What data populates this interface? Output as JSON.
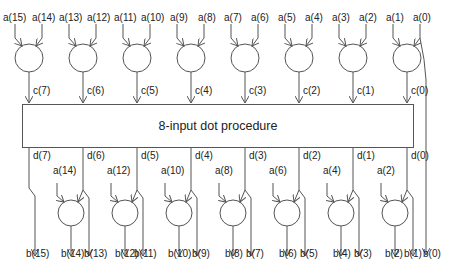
{
  "diagram": {
    "title": "8-input dot procedure",
    "colors": {
      "stroke": "#555555",
      "text": "#222222",
      "background": "#ffffff"
    },
    "top_groups": [
      {
        "inputs": [
          "a(15)",
          "a(14)"
        ],
        "output": "c(7)"
      },
      {
        "inputs": [
          "a(13)",
          "a(12)"
        ],
        "output": "c(6)"
      },
      {
        "inputs": [
          "a(11)",
          "a(10)"
        ],
        "output": "c(5)"
      },
      {
        "inputs": [
          "a(9)",
          "a(8)"
        ],
        "output": "c(4)"
      },
      {
        "inputs": [
          "a(7)",
          "a(6)"
        ],
        "output": "c(3)"
      },
      {
        "inputs": [
          "a(5)",
          "a(4)"
        ],
        "output": "c(2)"
      },
      {
        "inputs": [
          "a(3)",
          "a(2)"
        ],
        "output": "c(1)"
      },
      {
        "inputs": [
          "a(1)",
          "a(0)"
        ],
        "output": "c(0)"
      }
    ],
    "bottom_groups": [
      {
        "d": "d(7)",
        "b_pass": "b(15)",
        "a_in": "a(14)",
        "b_circle": "b(14)",
        "b_right": "b(13)"
      },
      {
        "d": "d(6)",
        "a_in": "a(12)",
        "b_circle": "b(12)",
        "b_right": "b(11)"
      },
      {
        "d": "d(5)",
        "a_in": "a(10)",
        "b_circle": "b(10)",
        "b_right": "b(9)"
      },
      {
        "d": "d(4)",
        "a_in": "a(8)",
        "b_circle": "b(8)",
        "b_right": "b(7)"
      },
      {
        "d": "d(3)",
        "a_in": "a(6)",
        "b_circle": "b(6)",
        "b_right": "b(5)"
      },
      {
        "d": "d(2)",
        "a_in": "a(4)",
        "b_circle": "b(4)",
        "b_right": "b(3)"
      },
      {
        "d": "d(1)",
        "a_in": "a(2)",
        "b_circle": "b(2)",
        "b_right": "b(1)"
      },
      {
        "d": "d(0)"
      }
    ],
    "bypass_output": "b(0)",
    "labels": {
      "a15": "a(15)",
      "a14": "a(14)",
      "a13": "a(13)",
      "a12": "a(12)",
      "a11": "a(11)",
      "a10": "a(10)",
      "a9": "a(9)",
      "a8": "a(8)",
      "a7": "a(7)",
      "a6": "a(6)",
      "a5": "a(5)",
      "a4": "a(4)",
      "a3": "a(3)",
      "a2": "a(2)",
      "a1": "a(1)",
      "a0": "a(0)",
      "c7": "c(7)",
      "c6": "c(6)",
      "c5": "c(5)",
      "c4": "c(4)",
      "c3": "c(3)",
      "c2": "c(2)",
      "c1": "c(1)",
      "c0": "c(0)",
      "d7": "d(7)",
      "d6": "d(6)",
      "d5": "d(5)",
      "d4": "d(4)",
      "d3": "d(3)",
      "d2": "d(2)",
      "d1": "d(1)",
      "d0": "d(0)",
      "ba14": "a(14)",
      "ba12": "a(12)",
      "ba10": "a(10)",
      "ba8": "a(8)",
      "ba6": "a(6)",
      "ba4": "a(4)",
      "ba2": "a(2)",
      "b15": "b(15)",
      "b14": "b(14)",
      "b13": "b(13)",
      "b12": "b(12)",
      "b11": "b(11)",
      "b10": "b(10)",
      "b9": "b(9)",
      "b8": "b(8)",
      "b7": "b(7)",
      "b6": "b(6)",
      "b5": "b(5)",
      "b4": "b(4)",
      "b3": "b(3)",
      "b2": "b(2)",
      "b1": "b(1)",
      "b0": "b(0)"
    }
  }
}
